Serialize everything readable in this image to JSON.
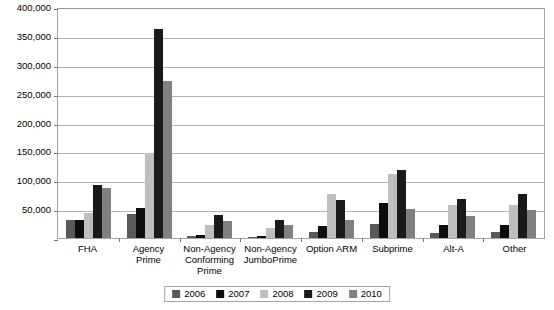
{
  "chart_data": {
    "type": "bar",
    "title": "",
    "subtitle": "",
    "xlabel": "",
    "ylabel": "",
    "ylim": [
      0,
      400000
    ],
    "grid": true,
    "legend_position": "bottom",
    "y_ticks": [
      {
        "value": 0,
        "label": ""
      },
      {
        "value": 50000,
        "label": "50,000"
      },
      {
        "value": 100000,
        "label": "100,000"
      },
      {
        "value": 150000,
        "label": "150,000"
      },
      {
        "value": 200000,
        "label": "200,000"
      },
      {
        "value": 250000,
        "label": "250,000"
      },
      {
        "value": 300000,
        "label": "300,000"
      },
      {
        "value": 350000,
        "label": "350,000"
      },
      {
        "value": 400000,
        "label": "400,000"
      }
    ],
    "categories": [
      "FHA",
      "Agency Prime",
      "Non-Agency Conforming Prime",
      "Non-Agency JumboPrime",
      "Option ARM",
      "Subprime",
      "Alt-A",
      "Other"
    ],
    "series": [
      {
        "name": "2006",
        "color": "#595959",
        "values": [
          32000,
          42000,
          3000,
          2000,
          10000,
          25000,
          8000,
          10000
        ]
      },
      {
        "name": "2007",
        "color": "#0d0d0d",
        "values": [
          32000,
          52000,
          5000,
          3000,
          20000,
          60000,
          22000,
          22000
        ]
      },
      {
        "name": "2008",
        "color": "#bfbfbf",
        "values": [
          44000,
          147000,
          22000,
          18000,
          77000,
          110000,
          58000,
          58000
        ]
      },
      {
        "name": "2009",
        "color": "#1a1a1a",
        "values": [
          92000,
          362000,
          40000,
          32000,
          65000,
          118000,
          68000,
          77000
        ]
      },
      {
        "name": "2010",
        "color": "#808080",
        "values": [
          87000,
          272000,
          30000,
          22000,
          32000,
          50000,
          38000,
          48000
        ]
      }
    ]
  },
  "legend": {
    "items": [
      {
        "label": "2006"
      },
      {
        "label": "2007"
      },
      {
        "label": "2008"
      },
      {
        "label": "2009"
      },
      {
        "label": "2010"
      }
    ]
  }
}
